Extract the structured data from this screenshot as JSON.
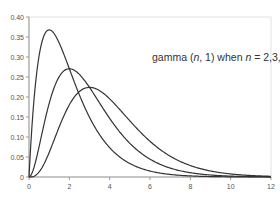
{
  "chart_data": {
    "type": "line",
    "title": "",
    "annotation": {
      "prefix": "gamma (",
      "n_var": "n",
      "mid": ", 1) when ",
      "n_var2": "n",
      "suffix": " = 2,3,4"
    },
    "xlabel": "",
    "ylabel": "",
    "xlim": [
      0,
      12
    ],
    "ylim": [
      0,
      0.4
    ],
    "x_ticks": [
      "0",
      "2",
      "4",
      "6",
      "8",
      "10",
      "12"
    ],
    "y_ticks": [
      "0",
      "0.05",
      "0.10",
      "0.15",
      "0.20",
      "0.25",
      "0.30",
      "0.35",
      "0.40"
    ],
    "grid": false,
    "legend": "none",
    "x": [
      0,
      0.5,
      1,
      1.5,
      2,
      2.5,
      3,
      3.5,
      4,
      5,
      6,
      7,
      8,
      9,
      10,
      11,
      12
    ],
    "series": [
      {
        "name": "n = 2",
        "values": [
          0,
          0.303,
          0.368,
          0.335,
          0.271,
          0.205,
          0.149,
          0.106,
          0.073,
          0.034,
          0.015,
          0.006,
          0.003,
          0.001,
          0.0005,
          0.0002,
          0.0001
        ]
      },
      {
        "name": "n = 3",
        "values": [
          0,
          0.076,
          0.184,
          0.251,
          0.271,
          0.257,
          0.224,
          0.185,
          0.147,
          0.084,
          0.045,
          0.022,
          0.011,
          0.005,
          0.002,
          0.001,
          0.0004
        ]
      },
      {
        "name": "n = 4",
        "values": [
          0,
          0.013,
          0.061,
          0.126,
          0.18,
          0.214,
          0.224,
          0.216,
          0.195,
          0.14,
          0.089,
          0.052,
          0.029,
          0.015,
          0.008,
          0.004,
          0.002
        ]
      }
    ],
    "colors": {
      "curve": "#333333",
      "axis": "#999999",
      "frame": "#dddddd"
    }
  }
}
